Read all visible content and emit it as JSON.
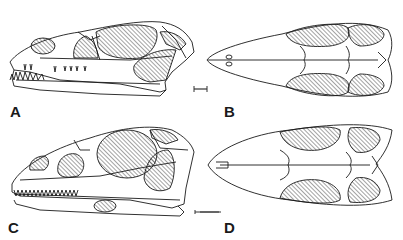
{
  "figure": {
    "panels": [
      {
        "id": "A",
        "label": "A",
        "view": "lateral"
      },
      {
        "id": "B",
        "label": "B",
        "view": "dorsal"
      },
      {
        "id": "C",
        "label": "C",
        "view": "lateral"
      },
      {
        "id": "D",
        "label": "D",
        "view": "dorsal"
      }
    ],
    "colors": {
      "line": "#1a1a1a",
      "hatch": "#333333",
      "background": "#ffffff"
    }
  }
}
